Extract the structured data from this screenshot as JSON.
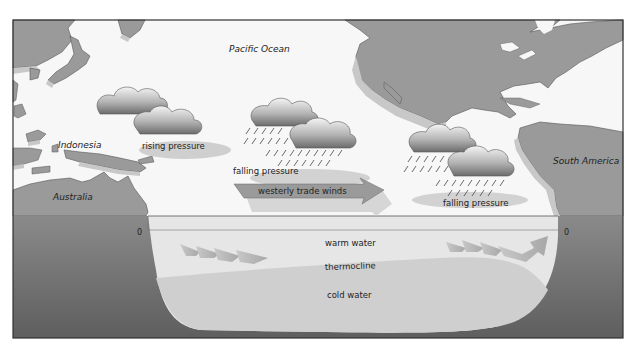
{
  "diagram": {
    "labels": {
      "pacific_ocean": "Pacific Ocean",
      "indonesia": "Indonesia",
      "australia": "Australia",
      "south_america": "South America",
      "rising_pressure": "rising pressure",
      "falling_pressure_center": "falling pressure",
      "falling_pressure_east": "falling pressure",
      "westerly_trade_winds": "westerly trade winds",
      "warm_water": "warm water",
      "thermocline": "thermocline",
      "cold_water": "cold water",
      "depth_zero_left": "0",
      "depth_zero_right": "0"
    },
    "colors": {
      "land": "#9a9a9a",
      "land_edge": "#c8c8c8",
      "sky": "#f7f7f7",
      "seafloor": "#6e6e6e",
      "warm_water": "#e6e6e6",
      "cold_water": "#cfcfcf",
      "arrow": "#8c8c8c",
      "frame": "#333333"
    }
  }
}
